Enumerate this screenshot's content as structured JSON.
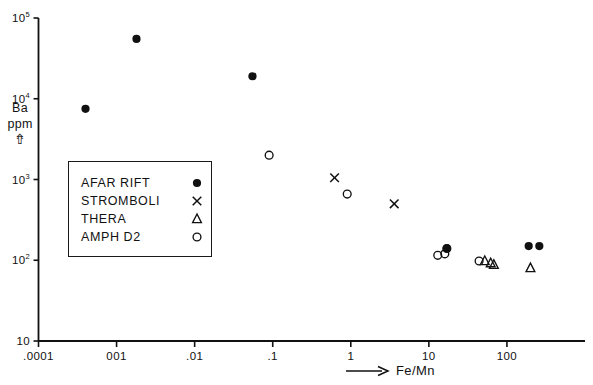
{
  "figure": {
    "type": "scatter",
    "background": "#ffffff",
    "ink_color": "#111111"
  },
  "axes": {
    "x": {
      "label": "Fe/Mn",
      "label_arrow": "arrow-right",
      "scale": "log",
      "tick_labels": [
        ".0001",
        "001",
        ".01",
        ".1",
        "1",
        "10",
        "100"
      ],
      "tick_values": [
        0.0001,
        0.001,
        0.01,
        0.1,
        1,
        10,
        100
      ],
      "range": [
        0.0001,
        1000
      ]
    },
    "y": {
      "label_lines": [
        "Ba",
        "ppm"
      ],
      "label_arrow": "arrow-up",
      "scale": "log",
      "tick_labels": [
        "10",
        "10",
        "10",
        "10",
        "10"
      ],
      "tick_exponents": [
        "5",
        "4",
        "3",
        "2",
        ""
      ],
      "tick_values": [
        100000,
        10000,
        1000,
        100,
        10
      ],
      "range": [
        10,
        100000
      ]
    }
  },
  "legend": {
    "position": "inside-left",
    "entries": [
      {
        "label": "AFAR RIFT",
        "marker": "filled-circle"
      },
      {
        "label": "STROMBOLI",
        "marker": "cross"
      },
      {
        "label": "THERA",
        "marker": "open-triangle"
      },
      {
        "label": "AMPH D2",
        "marker": "open-circle"
      }
    ]
  },
  "chart_data": {
    "type": "scatter",
    "title": "",
    "xlabel": "Fe/Mn",
    "ylabel": "Ba ppm",
    "xscale": "log",
    "yscale": "log",
    "xlim": [
      0.0001,
      1000
    ],
    "ylim": [
      10,
      100000
    ],
    "grid": false,
    "legend_position": "inside-left",
    "series": [
      {
        "name": "AFAR RIFT",
        "marker": "filled-circle",
        "points": [
          {
            "x": 0.0004,
            "y": 7500
          },
          {
            "x": 0.0018,
            "y": 55000
          },
          {
            "x": 0.055,
            "y": 19000
          },
          {
            "x": 17,
            "y": 140
          },
          {
            "x": 190,
            "y": 150
          },
          {
            "x": 260,
            "y": 150
          }
        ]
      },
      {
        "name": "STROMBOLI",
        "marker": "cross",
        "points": [
          {
            "x": 0.62,
            "y": 1050
          },
          {
            "x": 3.6,
            "y": 500
          }
        ]
      },
      {
        "name": "THERA",
        "marker": "open-triangle",
        "points": [
          {
            "x": 52,
            "y": 98
          },
          {
            "x": 62,
            "y": 92
          },
          {
            "x": 68,
            "y": 88
          },
          {
            "x": 200,
            "y": 80
          }
        ]
      },
      {
        "name": "AMPH D2",
        "marker": "open-circle",
        "points": [
          {
            "x": 0.09,
            "y": 2000
          },
          {
            "x": 0.9,
            "y": 660
          },
          {
            "x": 13,
            "y": 115
          },
          {
            "x": 16,
            "y": 120
          },
          {
            "x": 17,
            "y": 140
          },
          {
            "x": 44,
            "y": 98
          }
        ]
      }
    ]
  }
}
